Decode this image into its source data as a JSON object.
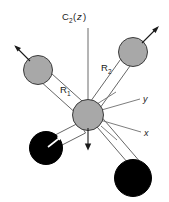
{
  "figure": {
    "title_label": "C",
    "symmetry_axis": {
      "name": "C2(z)",
      "base": "C",
      "subscript": "2",
      "paren_open": "(",
      "axis_letter": "z",
      "paren_close": ")"
    },
    "bond_labels": [
      {
        "base": "R",
        "subscript": "1",
        "name": "R1"
      },
      {
        "base": "R",
        "subscript": "2",
        "name": "R2"
      }
    ],
    "axes": [
      {
        "label": "y",
        "name": "y-axis"
      },
      {
        "label": "x",
        "name": "x-axis"
      }
    ],
    "colors": {
      "atom_gray": "#a8a8a8",
      "atom_black": "#000000",
      "atom_outline": "#3c3c3c",
      "bond_outline": "#555555",
      "axis_line": "#6e6e6e",
      "background": "#ffffff",
      "text": "#1a1a1a"
    },
    "atoms": [
      {
        "name": "central-atom",
        "type": "gray",
        "cx": 88,
        "cy": 115,
        "r": 15.5
      },
      {
        "name": "upper-left-atom",
        "type": "gray",
        "cx": 38,
        "cy": 70,
        "r": 14.5
      },
      {
        "name": "upper-right-atom",
        "type": "gray",
        "cx": 133,
        "cy": 52,
        "r": 14.5
      },
      {
        "name": "lower-left-atom",
        "type": "black",
        "cx": 46,
        "cy": 148,
        "r": 16.5
      },
      {
        "name": "lower-right-atom",
        "type": "black",
        "cx": 133,
        "cy": 178,
        "r": 18.5
      }
    ],
    "displacement_arrows": [
      {
        "name": "upper-left-displacement-arrow",
        "direction": "up-left"
      },
      {
        "name": "upper-right-displacement-arrow",
        "direction": "up-right"
      },
      {
        "name": "central-displacement-arrow",
        "direction": "down"
      },
      {
        "name": "lower-left-displacement-arrow",
        "direction": "up-right"
      }
    ]
  }
}
